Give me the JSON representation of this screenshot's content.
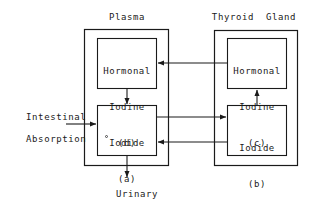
{
  "diagram": {
    "type": "block-flow",
    "stroke_color": "#1a1a1a",
    "background_color": "#ffffff",
    "compartments": [
      {
        "id": "plasma",
        "label": "Plasma"
      },
      {
        "id": "thyroid",
        "label": "Thyroid  Gland"
      }
    ],
    "boxes": {
      "hormonal_iodine_d": {
        "line1": "Hormonal",
        "line2": "Iodine",
        "line3": "(d)",
        "compartment": "plasma"
      },
      "iodide_a": {
        "line1": "Iodide",
        "line2": "(a)",
        "compartment": "plasma"
      },
      "hormonal_iodine_c": {
        "line1": "Hormonal",
        "line2": "Iodine",
        "line3": "(c)",
        "compartment": "thyroid"
      },
      "iodide_b": {
        "line1": "Iodide",
        "line2": "(b)",
        "compartment": "thyroid"
      }
    },
    "external_flows": {
      "input": {
        "line1": "Intestinal",
        "line2": "Absorption",
        "direction": "into-plasma-iodide"
      },
      "output": {
        "line1": "Urinary",
        "line2": "Excretion",
        "direction": "out-of-plasma-iodide"
      }
    },
    "arrows": [
      {
        "id": "intestinal-to-iodide-a",
        "from": "Intestinal Absorption",
        "to": "Iodide (a)"
      },
      {
        "id": "iodide-a-to-urinary",
        "from": "Iodide (a)",
        "to": "Urinary Excretion"
      },
      {
        "id": "hormonal-d-to-iodide-a",
        "from": "Hormonal Iodine (d)",
        "to": "Iodide (a)"
      },
      {
        "id": "iodide-a-to-iodide-b",
        "from": "Iodide (a)",
        "to": "Iodide (b)"
      },
      {
        "id": "iodide-b-to-iodide-a",
        "from": "Iodide (b)",
        "to": "Iodide (a)"
      },
      {
        "id": "iodide-b-to-hormonal-c",
        "from": "Iodide (b)",
        "to": "Hormonal Iodine (c)"
      },
      {
        "id": "hormonal-c-to-hormonal-d",
        "from": "Hormonal Iodine (c)",
        "to": "Hormonal Iodine (d)"
      }
    ]
  }
}
